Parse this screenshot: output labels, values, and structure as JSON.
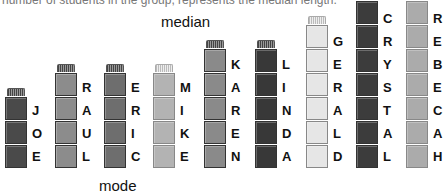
{
  "caption": "number of students in the group, represents the median length.",
  "labels": {
    "median": "median",
    "mode": "mode"
  },
  "columns": [
    {
      "name": "JOE",
      "letters": [
        "J",
        "O",
        "E"
      ],
      "color": "#4a4a4a",
      "cap": "dark",
      "left": 5
    },
    {
      "name": "RAUL",
      "letters": [
        "R",
        "A",
        "U",
        "L"
      ],
      "color": "#8c8c8c",
      "cap": "dark",
      "left": 55
    },
    {
      "name": "ERIC",
      "letters": [
        "E",
        "R",
        "I",
        "C"
      ],
      "color": "#6e6e6e",
      "cap": "dark",
      "left": 104
    },
    {
      "name": "MIKE",
      "letters": [
        "M",
        "I",
        "K",
        "E"
      ],
      "color": "#b3b3b3",
      "cap": "light",
      "left": 153
    },
    {
      "name": "KAREN",
      "letters": [
        "K",
        "A",
        "R",
        "E",
        "N"
      ],
      "color": "#8a8a8a",
      "cap": "dark",
      "left": 204
    },
    {
      "name": "LINDA",
      "letters": [
        "L",
        "I",
        "N",
        "D",
        "A"
      ],
      "color": "#383838",
      "cap": "dark",
      "left": 255
    },
    {
      "name": "GERALD",
      "letters": [
        "G",
        "E",
        "R",
        "A",
        "L",
        "D"
      ],
      "color": "#e6e6e6",
      "cap": "light",
      "left": 306
    },
    {
      "name": "CRYSTAL",
      "letters": [
        "C",
        "R",
        "Y",
        "S",
        "T",
        "A",
        "L"
      ],
      "color": "#3c3c3c",
      "cap": "dark",
      "left": 356
    },
    {
      "name": "REBECAH",
      "letters": [
        "R",
        "E",
        "B",
        "E",
        "C",
        "A",
        "H"
      ],
      "color": "#ababab",
      "cap": "light",
      "left": 406
    }
  ]
}
